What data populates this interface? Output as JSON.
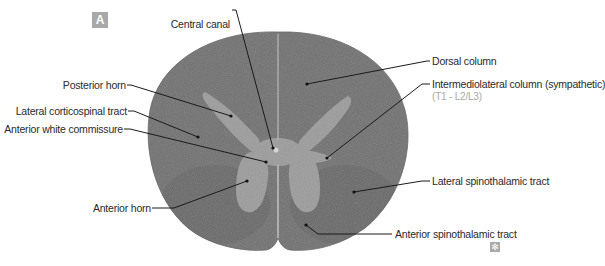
{
  "figure": {
    "panel_label": "A",
    "corner_icon": "✻",
    "colors": {
      "background": "#ffffff",
      "tissue_white_matter": "#6f6f6f",
      "tissue_gray_matter": "#9a9a9a",
      "leader_line": "#1a1a1a",
      "label_text": "#2a2a2a",
      "sub_text": "#a9a9a9",
      "badge": "#a8a8a8"
    }
  },
  "labels": {
    "central_canal": "Central canal",
    "posterior_horn": "Posterior horn",
    "lateral_corticospinal_tract": "Lateral corticospinal tract",
    "anterior_white_commissure": "Anterior white commissure",
    "anterior_horn": "Anterior horn",
    "dorsal_column": "Dorsal column",
    "intermediolateral_column": "Intermediolateral column (sympathetic)",
    "intermediolateral_levels": "(T1 - L2/L3)",
    "lateral_spinothalamic_tract": "Lateral spinothalamic tract",
    "anterior_spinothalamic_tract": "Anterior spinothalamic tract"
  }
}
